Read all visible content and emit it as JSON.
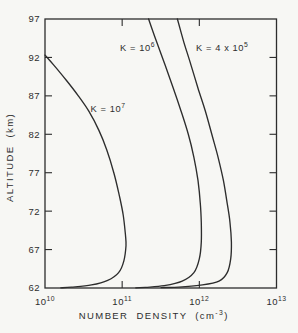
{
  "figure": {
    "background": "#f7f7f4",
    "ink": "#2d2d2d"
  },
  "chart_data": {
    "type": "line",
    "title": "",
    "xlabel": "NUMBER DENSITY (cm^-3)",
    "ylabel": "ALTITUDE (km)",
    "x_scale": "log",
    "xlim": [
      10000000000.0,
      10000000000000.0
    ],
    "ylim": [
      62,
      97
    ],
    "x_ticks": [
      {
        "value": 10000000000.0,
        "label": "10^10"
      },
      {
        "value": 100000000000.0,
        "label": "10^11"
      },
      {
        "value": 1000000000000.0,
        "label": "10^12"
      },
      {
        "value": 10000000000000.0,
        "label": "10^13"
      }
    ],
    "y_ticks": [
      97,
      92,
      87,
      82,
      77,
      72,
      67,
      62
    ],
    "grid": false,
    "legend": "inline-labels",
    "series": [
      {
        "name": "K = 10^7",
        "label_at": [
          39000000000.0,
          85.3
        ],
        "points": [
          [
            10000000000.0,
            92.3
          ],
          [
            13000000000.0,
            91
          ],
          [
            19000000000.0,
            89
          ],
          [
            27000000000.0,
            87
          ],
          [
            37000000000.0,
            85
          ],
          [
            50000000000.0,
            82.5
          ],
          [
            63000000000.0,
            80
          ],
          [
            78000000000.0,
            77
          ],
          [
            92000000000.0,
            74
          ],
          [
            103000000000.0,
            71.5
          ],
          [
            110000000000.0,
            69
          ],
          [
            112000000000.0,
            67.5
          ],
          [
            105000000000.0,
            65.5
          ],
          [
            90000000000.0,
            64
          ],
          [
            65000000000.0,
            63
          ],
          [
            40000000000.0,
            62.4
          ],
          [
            22000000000.0,
            62.1
          ],
          [
            16000000000.0,
            62.02
          ]
        ]
      },
      {
        "name": "K = 10^6",
        "label_at": [
          94000000000.0,
          93.2
        ],
        "points": [
          [
            220000000000.0,
            97
          ],
          [
            280000000000.0,
            94
          ],
          [
            360000000000.0,
            91
          ],
          [
            460000000000.0,
            88
          ],
          [
            580000000000.0,
            85
          ],
          [
            720000000000.0,
            82
          ],
          [
            850000000000.0,
            79
          ],
          [
            960000000000.0,
            76
          ],
          [
            1030000000000.0,
            73
          ],
          [
            1060000000000.0,
            70.5
          ],
          [
            1060000000000.0,
            68
          ],
          [
            1000000000000.0,
            65.8
          ],
          [
            850000000000.0,
            64
          ],
          [
            600000000000.0,
            62.9
          ],
          [
            350000000000.0,
            62.3
          ],
          [
            200000000000.0,
            62.08
          ],
          [
            150000000000.0,
            62.02
          ]
        ]
      },
      {
        "name": "K = 4 x 10^5",
        "label_at": [
          905000000000.0,
          93.2
        ],
        "points": [
          [
            520000000000.0,
            97
          ],
          [
            630000000000.0,
            94
          ],
          [
            780000000000.0,
            91
          ],
          [
            960000000000.0,
            88
          ],
          [
            1200000000000.0,
            85
          ],
          [
            1450000000000.0,
            82
          ],
          [
            1750000000000.0,
            79
          ],
          [
            2050000000000.0,
            76
          ],
          [
            2300000000000.0,
            73
          ],
          [
            2500000000000.0,
            70.5
          ],
          [
            2600000000000.0,
            68
          ],
          [
            2550000000000.0,
            65.8
          ],
          [
            2300000000000.0,
            64
          ],
          [
            1800000000000.0,
            62.9
          ],
          [
            1100000000000.0,
            62.4
          ],
          [
            600000000000.0,
            62.15
          ],
          [
            320000000000.0,
            62.05
          ]
        ]
      }
    ]
  }
}
